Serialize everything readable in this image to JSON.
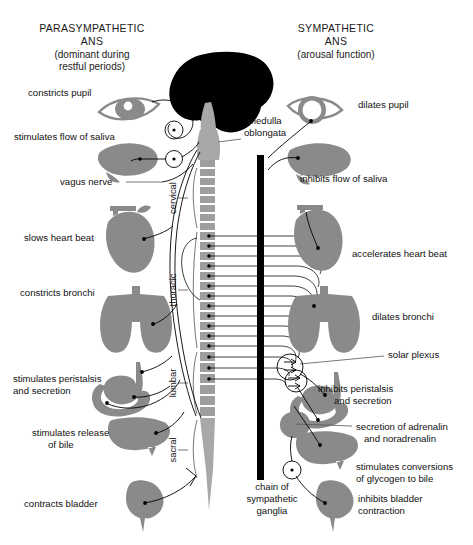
{
  "headers": {
    "left": {
      "title_line1": "PARASYMPATHETIC",
      "title_line2": "ANS",
      "sub_line1": "(dominant during",
      "sub_line2": "restful periods)"
    },
    "right": {
      "title_line1": "SYMPATHETIC",
      "title_line2": "ANS",
      "sub_line1": "(arousal function)"
    }
  },
  "left_labels": {
    "pupil": "constricts pupil",
    "saliva": "stimulates flow of saliva",
    "vagus": "vagus nerve",
    "heart": "slows heart beat",
    "bronchi": "constricts bronchi",
    "peristalsis_line1": "stimulates peristalsis",
    "peristalsis_line2": "and secretion",
    "bile_line1": "stimulates release",
    "bile_line2": "of bile",
    "bladder": "contracts bladder"
  },
  "right_labels": {
    "pupil": "dilates pupil",
    "medulla_line1": "medulla",
    "medulla_line2": "oblongata",
    "saliva": "inhibits flow of saliva",
    "heart": "accelerates heart beat",
    "bronchi": "dilates bronchi",
    "solar_plexus": "solar plexus",
    "peristalsis_line1": "inhibits peristalsis",
    "peristalsis_line2": "and secretion",
    "adrenalin_line1": "secretion of adrenalin",
    "adrenalin_line2": "and noradrenalin",
    "glycogen_line1": "stimulates conversions",
    "glycogen_line2": "of glycogen to bile",
    "bladder_line1": "inhibits bladder",
    "bladder_line2": "contraction"
  },
  "center_labels": {
    "chain_line1": "chain of",
    "chain_line2": "sympathetic",
    "chain_line3": "ganglia"
  },
  "spine_regions": {
    "cervical": "cervical",
    "thoracic": "thoracic",
    "lumbar": "lumbar",
    "sacral": "sacral"
  },
  "colors": {
    "background": "#ffffff",
    "organ_gray": "#8a8a8a",
    "brain_black": "#000000",
    "brainstem_gray": "#a8a8a8",
    "vertebra_gray": "#9e9e9e",
    "chain_black": "#000000",
    "text_black": "#111111",
    "leader_gray": "#555555"
  }
}
